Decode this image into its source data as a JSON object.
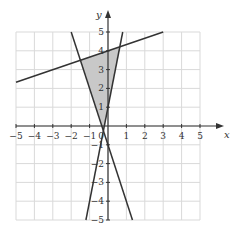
{
  "chart_data": {
    "type": "line",
    "title": "",
    "xlabel": "x",
    "ylabel": "y",
    "xlim": [
      -5,
      5
    ],
    "ylim": [
      -5,
      5
    ],
    "grid": true,
    "x_ticks": [
      -5,
      -4,
      -3,
      -2,
      -1,
      1,
      2,
      3,
      4,
      5
    ],
    "y_ticks": [
      -5,
      -4,
      -3,
      -2,
      -1,
      1,
      2,
      3,
      4,
      5
    ],
    "x_tick_labels": [
      "−5",
      "−4",
      "−3",
      "−2",
      "−1",
      "1",
      "2",
      "3",
      "4",
      "5"
    ],
    "y_tick_labels": [
      "−5",
      "−4",
      "−3",
      "−2",
      "−1",
      "1",
      "2",
      "3",
      "4",
      "5"
    ],
    "series": [
      {
        "name": "line-1",
        "equation": "y = x/3 + 4",
        "points": [
          [
            -5,
            2.33
          ],
          [
            3,
            5
          ]
        ]
      },
      {
        "name": "line-2",
        "equation": "y = -3x - 1",
        "points": [
          [
            -2,
            5
          ],
          [
            1.33,
            -5
          ]
        ]
      },
      {
        "name": "line-3",
        "equation": "y = 5x + 1",
        "points": [
          [
            0.8,
            5
          ],
          [
            -1.2,
            -5
          ]
        ]
      }
    ],
    "shaded_region": {
      "description": "triangle bounded by the three lines",
      "vertices": [
        [
          -1.5,
          3.5
        ],
        [
          0.643,
          4.214
        ],
        [
          -0.25,
          -0.25
        ]
      ],
      "color": "#c8c8c8"
    },
    "colors": {
      "line": "#333333",
      "grid": "#d9d9d9",
      "shade": "#c8c8c8",
      "axis": "#333333"
    }
  }
}
